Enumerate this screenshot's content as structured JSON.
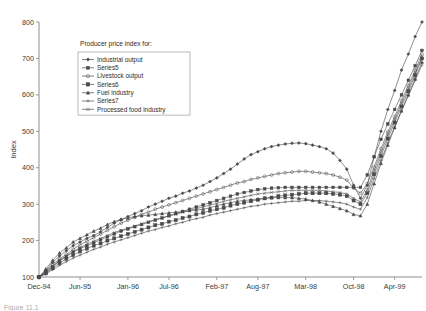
{
  "caption": "Figure 11.1",
  "legend": {
    "title": "Producer price index for:",
    "items": [
      {
        "label": "Industrial output",
        "marker": "diamond-filled"
      },
      {
        "label": "Series5",
        "marker": "square-filled"
      },
      {
        "label": "Livestock output",
        "marker": "circle-filled"
      },
      {
        "label": "Series6",
        "marker": "square-large-filled"
      },
      {
        "label": "Fuel industry",
        "marker": "triangle-filled"
      },
      {
        "label": "Series7",
        "marker": "plus"
      },
      {
        "label": "Processed food industry",
        "marker": "cross"
      }
    ]
  },
  "chart_data": {
    "type": "line",
    "title": "",
    "xlabel": "",
    "ylabel": "Index",
    "ylim": [
      100,
      800
    ],
    "yticks": [
      100,
      200,
      300,
      400,
      500,
      600,
      700,
      800
    ],
    "grid": false,
    "legend_position": "top-left-inside",
    "x_tick_labels": [
      "Dec-94",
      "Jun-95",
      "Jan-96",
      "Jul-96",
      "Feb-97",
      "Aug-97",
      "Mar-98",
      "Oct-98",
      "Apr-99"
    ],
    "x_tick_indices": [
      0,
      6,
      13,
      19,
      26,
      32,
      39,
      46,
      52
    ],
    "x_count": 57,
    "series": [
      {
        "name": "Industrial output",
        "marker": "diamond-filled",
        "values": [
          100,
          118,
          140,
          158,
          172,
          186,
          196,
          206,
          214,
          224,
          236,
          248,
          258,
          266,
          274,
          282,
          292,
          300,
          308,
          316,
          322,
          330,
          336,
          344,
          352,
          362,
          372,
          384,
          396,
          410,
          424,
          436,
          444,
          452,
          458,
          462,
          465,
          467,
          468,
          466,
          462,
          458,
          452,
          440,
          420,
          396,
          352,
          316,
          352,
          430,
          500,
          560,
          612,
          668,
          712,
          760,
          800
        ]
      },
      {
        "name": "Series5",
        "marker": "square-filled",
        "values": [
          100,
          112,
          128,
          144,
          156,
          168,
          178,
          186,
          194,
          202,
          210,
          218,
          226,
          232,
          238,
          244,
          250,
          256,
          262,
          268,
          274,
          280,
          286,
          292,
          298,
          304,
          310,
          316,
          322,
          328,
          332,
          336,
          340,
          342,
          344,
          345,
          346,
          346,
          346,
          346,
          346,
          346,
          346,
          346,
          346,
          346,
          346,
          346,
          380,
          430,
          478,
          520,
          560,
          600,
          640,
          680,
          722
        ]
      },
      {
        "name": "Livestock output",
        "marker": "circle-filled",
        "values": [
          100,
          116,
          134,
          150,
          162,
          176,
          188,
          198,
          208,
          218,
          228,
          238,
          248,
          256,
          264,
          272,
          278,
          286,
          292,
          298,
          304,
          310,
          316,
          322,
          328,
          334,
          340,
          346,
          352,
          358,
          362,
          368,
          372,
          376,
          380,
          384,
          386,
          388,
          390,
          390,
          388,
          386,
          384,
          380,
          374,
          366,
          344,
          330,
          356,
          402,
          452,
          498,
          540,
          584,
          626,
          668,
          712
        ]
      },
      {
        "name": "Series6",
        "marker": "square-large-filled",
        "values": [
          100,
          110,
          124,
          138,
          150,
          160,
          170,
          178,
          186,
          192,
          200,
          206,
          212,
          218,
          224,
          230,
          236,
          242,
          246,
          252,
          256,
          262,
          266,
          272,
          276,
          282,
          286,
          290,
          296,
          300,
          304,
          308,
          312,
          316,
          318,
          322,
          324,
          326,
          328,
          330,
          330,
          330,
          330,
          328,
          326,
          322,
          310,
          300,
          330,
          382,
          432,
          480,
          524,
          568,
          610,
          654,
          700
        ]
      },
      {
        "name": "Fuel industry",
        "marker": "triangle-filled",
        "values": [
          100,
          122,
          146,
          166,
          180,
          196,
          206,
          216,
          226,
          234,
          244,
          252,
          258,
          262,
          266,
          268,
          270,
          272,
          274,
          276,
          278,
          280,
          282,
          284,
          286,
          290,
          296,
          300,
          304,
          308,
          310,
          312,
          314,
          316,
          318,
          318,
          318,
          318,
          316,
          314,
          310,
          306,
          300,
          294,
          288,
          282,
          272,
          268,
          300,
          356,
          412,
          462,
          510,
          556,
          600,
          644,
          690
        ]
      },
      {
        "name": "Series7",
        "marker": "plus",
        "values": [
          100,
          108,
          120,
          132,
          142,
          152,
          160,
          168,
          176,
          182,
          190,
          196,
          202,
          208,
          214,
          220,
          226,
          230,
          236,
          240,
          246,
          250,
          256,
          260,
          264,
          270,
          274,
          278,
          282,
          286,
          290,
          294,
          296,
          300,
          302,
          304,
          306,
          308,
          308,
          310,
          310,
          310,
          308,
          306,
          304,
          300,
          292,
          286,
          318,
          370,
          420,
          468,
          512,
          556,
          598,
          640,
          682
        ]
      },
      {
        "name": "Processed food industry",
        "marker": "cross",
        "values": [
          100,
          114,
          130,
          146,
          158,
          170,
          180,
          190,
          198,
          206,
          214,
          222,
          228,
          234,
          240,
          246,
          252,
          258,
          262,
          268,
          272,
          278,
          282,
          288,
          292,
          298,
          302,
          308,
          312,
          316,
          320,
          324,
          328,
          330,
          332,
          334,
          336,
          338,
          338,
          338,
          338,
          338,
          336,
          334,
          332,
          328,
          316,
          306,
          340,
          392,
          442,
          490,
          532,
          576,
          618,
          660,
          704
        ]
      }
    ]
  }
}
